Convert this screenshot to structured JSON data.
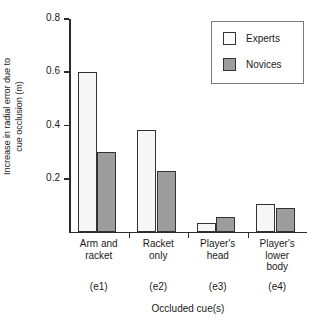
{
  "chart_data": {
    "type": "bar",
    "title": "",
    "xlabel": "Occluded cue(s)",
    "ylabel_lines": [
      "Increase in radial error due to",
      "cue occlusion (m)"
    ],
    "ylabel": "Increase in radial error due to cue occlusion (m)",
    "categories": [
      "Arm and\nracket",
      "Racket\nonly",
      "Player's\nhead",
      "Player's\nlower\nbody"
    ],
    "category_codes": [
      "(e1)",
      "(e2)",
      "(e3)",
      "(e4)"
    ],
    "series": [
      {
        "name": "Experts",
        "values": [
          0.6,
          0.385,
          0.035,
          0.105
        ],
        "color": "#f7f7f7"
      },
      {
        "name": "Novices",
        "values": [
          0.3,
          0.23,
          0.055,
          0.09
        ],
        "color": "#9d9d9d"
      }
    ],
    "ylim": [
      0,
      0.8
    ],
    "yticks": [
      0.2,
      0.4,
      0.6,
      0.8
    ],
    "ytick_labels": [
      "0.2",
      "0.4",
      "0.6",
      "0.8"
    ],
    "grid": false,
    "legend_position": "top-right",
    "legend_entries": [
      "Experts",
      "Novices"
    ],
    "axis_color": "#2b2b2b",
    "bar_edge_color": "#333333"
  }
}
